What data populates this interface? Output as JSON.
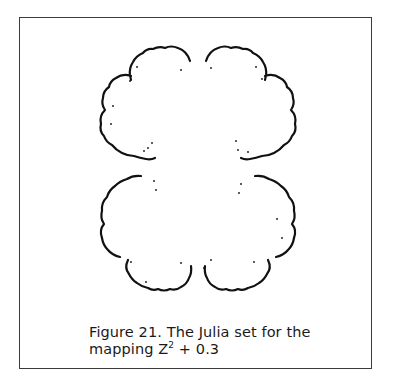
{
  "figure": {
    "number_label": "Figure 21.",
    "caption_line1": "The Julia set for the",
    "caption_line2_prefix": "mapping",
    "variable": "Z",
    "exponent": "2",
    "caption_line2_suffix": "+ 0.3",
    "ink_color": "#111111",
    "frame_color": "#3a3a3a"
  }
}
